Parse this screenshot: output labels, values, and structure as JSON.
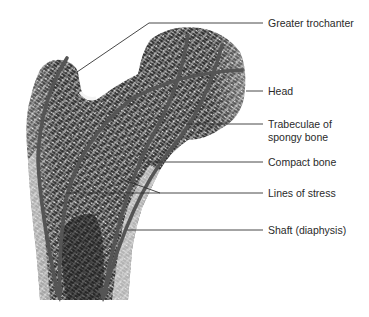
{
  "figure": {
    "labels": [
      {
        "id": "greater-trochanter",
        "text": "Greater trochanter",
        "x": 268,
        "y": 17
      },
      {
        "id": "head",
        "text": "Head",
        "x": 268,
        "y": 85
      },
      {
        "id": "trabeculae",
        "text": "Trabeculae of",
        "text2": "spongy bone",
        "x": 268,
        "y": 118
      },
      {
        "id": "compact-bone",
        "text": "Compact bone",
        "x": 268,
        "y": 155
      },
      {
        "id": "lines-of-stress",
        "text": "Lines of stress",
        "x": 268,
        "y": 184
      },
      {
        "id": "shaft",
        "text": "Shaft (diaphysis)",
        "x": 268,
        "y": 221
      }
    ],
    "colors": {
      "stress_line": "#555555",
      "leader_line": "#333333",
      "bone_dark": "#1e1e1e",
      "bone_mid": "#7a7a7a",
      "bone_light": "#d8d8d8",
      "background": "#ffffff",
      "text": "#2a2a2a"
    }
  }
}
